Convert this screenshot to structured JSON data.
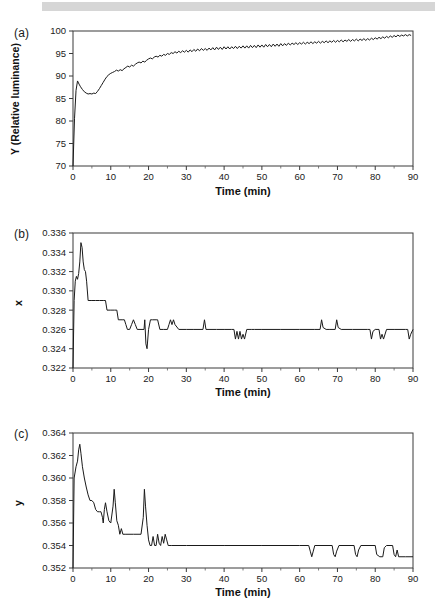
{
  "figure": {
    "background_color": "#ffffff",
    "line_color": "#1a1a1a",
    "axis_color": "#3a3a3a",
    "scan_band_color": "#d6d6d6"
  },
  "panels": [
    {
      "label": "(a)",
      "ylabel": "Y (Relative luminance)",
      "xlabel": "Time (min)",
      "yticks": [
        "70",
        "75",
        "80",
        "85",
        "90",
        "95",
        "100"
      ],
      "xticks": [
        "0",
        "10",
        "20",
        "30",
        "40",
        "50",
        "60",
        "70",
        "80",
        "90"
      ]
    },
    {
      "label": "(b)",
      "ylabel": "x",
      "xlabel": "Time (min)",
      "yticks": [
        "0.322",
        "0.324",
        "0.326",
        "0.328",
        "0.330",
        "0.332",
        "0.334",
        "0.336"
      ],
      "xticks": [
        "0",
        "10",
        "20",
        "30",
        "40",
        "50",
        "60",
        "70",
        "80",
        "90"
      ]
    },
    {
      "label": "(c)",
      "ylabel": "y",
      "xlabel": "Time (min)",
      "yticks": [
        "0.352",
        "0.354",
        "0.356",
        "0.358",
        "0.360",
        "0.362",
        "0.364"
      ],
      "xticks": [
        "0",
        "10",
        "20",
        "30",
        "40",
        "50",
        "60",
        "70",
        "80",
        "90"
      ]
    }
  ],
  "chart_data": [
    {
      "type": "line",
      "panel": "(a)",
      "title": "",
      "xlabel": "Time (min)",
      "ylabel": "Y (Relative luminance)",
      "xlim": [
        0,
        90
      ],
      "ylim": [
        70,
        100
      ],
      "ytick_values": [
        70,
        75,
        80,
        85,
        90,
        95,
        100
      ],
      "xtick_values": [
        0,
        10,
        20,
        30,
        40,
        50,
        60,
        70,
        80,
        90
      ],
      "grid": false,
      "legend": null,
      "x": [
        0,
        0.4,
        0.8,
        1.2,
        1.6,
        2,
        2.5,
        3,
        3.5,
        4,
        4.5,
        5,
        5.5,
        6,
        6.5,
        7,
        7.5,
        8,
        8.5,
        9,
        9.5,
        10,
        10.5,
        11,
        11.5,
        12,
        12.5,
        13,
        13.5,
        14,
        14.5,
        15,
        15.5,
        16,
        16.5,
        17,
        17.5,
        18,
        18.5,
        19,
        19.5,
        20,
        20.5,
        21,
        21.5,
        22,
        22.5,
        23,
        23.5,
        24,
        24.5,
        25,
        25.5,
        26,
        26.5,
        27,
        27.5,
        28,
        28.5,
        29,
        29.5,
        30,
        30.5,
        31,
        31.5,
        32,
        32.5,
        33,
        33.5,
        34,
        34.5,
        35,
        35.5,
        36,
        36.5,
        37,
        37.5,
        38,
        38.5,
        39,
        39.5,
        40,
        40.5,
        41,
        41.5,
        42,
        42.5,
        43,
        43.5,
        44,
        44.5,
        45,
        45.5,
        46,
        46.5,
        47,
        47.5,
        48,
        48.5,
        49,
        49.5,
        50,
        50.5,
        51,
        51.5,
        52,
        52.5,
        53,
        53.5,
        54,
        54.5,
        55,
        55.5,
        56,
        56.5,
        57,
        57.5,
        58,
        58.5,
        59,
        59.5,
        60,
        60.5,
        61,
        61.5,
        62,
        62.5,
        63,
        63.5,
        64,
        64.5,
        65,
        65.5,
        66,
        66.5,
        67,
        67.5,
        68,
        68.5,
        69,
        69.5,
        70,
        70.5,
        71,
        71.5,
        72,
        72.5,
        73,
        73.5,
        74,
        74.5,
        75,
        75.5,
        76,
        76.5,
        77,
        77.5,
        78,
        78.5,
        79,
        79.5,
        80,
        80.5,
        81,
        81.5,
        82,
        82.5,
        83,
        83.5,
        84,
        84.5,
        85,
        85.5,
        86,
        86.5,
        87,
        87.5,
        88,
        88.5,
        89,
        89.5,
        90
      ],
      "y": [
        70.0,
        80.5,
        86.8,
        88.9,
        88.2,
        87.6,
        87.0,
        86.5,
        86.2,
        86.0,
        86.1,
        86.0,
        86.2,
        86.1,
        86.6,
        87.2,
        87.9,
        88.6,
        89.3,
        89.9,
        90.3,
        90.6,
        90.8,
        91.0,
        91.3,
        91.1,
        91.4,
        91.2,
        91.6,
        91.9,
        92.2,
        92.0,
        92.4,
        92.2,
        92.6,
        92.9,
        93.1,
        92.9,
        93.3,
        93.1,
        93.5,
        93.8,
        94.0,
        93.8,
        94.2,
        94.4,
        94.2,
        94.6,
        94.4,
        94.8,
        94.6,
        95.0,
        94.8,
        95.2,
        95.0,
        95.4,
        95.1,
        95.5,
        95.2,
        95.6,
        95.3,
        95.7,
        95.3,
        95.8,
        95.4,
        95.9,
        95.5,
        96.0,
        95.6,
        96.1,
        95.7,
        96.1,
        95.7,
        96.2,
        95.8,
        96.3,
        95.8,
        96.4,
        95.9,
        96.4,
        95.9,
        96.5,
        96.0,
        96.5,
        96.0,
        96.5,
        96.1,
        96.6,
        96.1,
        96.6,
        96.2,
        96.7,
        96.2,
        96.7,
        96.2,
        96.8,
        96.3,
        96.8,
        96.3,
        96.9,
        96.4,
        96.9,
        96.4,
        97.0,
        96.5,
        97.0,
        96.5,
        97.1,
        96.6,
        97.1,
        96.6,
        97.2,
        96.7,
        97.2,
        96.8,
        97.3,
        96.9,
        97.3,
        97.0,
        97.4,
        97.0,
        97.4,
        97.1,
        97.5,
        97.1,
        97.5,
        97.2,
        97.6,
        97.2,
        97.6,
        97.3,
        97.7,
        97.3,
        97.7,
        97.4,
        97.8,
        97.4,
        97.8,
        97.5,
        97.9,
        97.5,
        97.9,
        97.6,
        98.0,
        97.6,
        98.0,
        97.7,
        98.1,
        97.7,
        98.1,
        97.8,
        98.2,
        97.8,
        98.2,
        97.9,
        98.3,
        97.9,
        98.3,
        98.0,
        98.4,
        98.1,
        98.5,
        98.2,
        98.6,
        98.3,
        98.7,
        98.4,
        98.8,
        98.5,
        98.9,
        98.6,
        99.0,
        98.7,
        99.1,
        98.8,
        99.1,
        98.9,
        99.2,
        98.9,
        99.2,
        99.0
      ]
    },
    {
      "type": "line",
      "panel": "(b)",
      "title": "",
      "xlabel": "Time (min)",
      "ylabel": "x",
      "xlim": [
        0,
        90
      ],
      "ylim": [
        0.322,
        0.336
      ],
      "ytick_values": [
        0.322,
        0.324,
        0.326,
        0.328,
        0.33,
        0.332,
        0.334,
        0.336
      ],
      "xtick_values": [
        0,
        10,
        20,
        30,
        40,
        50,
        60,
        70,
        80,
        90
      ],
      "grid": false,
      "legend": null,
      "x": [
        0,
        0.3,
        0.6,
        0.9,
        1.2,
        1.5,
        1.8,
        2.1,
        2.4,
        2.7,
        3.0,
        3.3,
        3.6,
        4.0,
        5.0,
        6.0,
        7.0,
        8.0,
        8.6,
        9.0,
        10.0,
        11.0,
        11.6,
        12.0,
        13.0,
        13.6,
        14.0,
        14.4,
        15.0,
        15.5,
        16.0,
        16.5,
        17.0,
        18.0,
        18.8,
        19.0,
        19.3,
        19.6,
        20.0,
        20.5,
        21.0,
        22.0,
        22.4,
        23.0,
        24.0,
        25.0,
        25.4,
        25.8,
        26.2,
        26.6,
        27.0,
        28.0,
        30.0,
        32.0,
        34.4,
        34.8,
        35.2,
        36.0,
        38.0,
        40.0,
        42.0,
        42.6,
        43.0,
        43.4,
        43.8,
        44.2,
        44.6,
        45.0,
        45.4,
        46.0,
        46.6,
        47.2,
        48.0,
        50.0,
        55.0,
        60.0,
        64.0,
        65.4,
        65.8,
        66.2,
        67.0,
        68.0,
        69.4,
        69.8,
        70.2,
        71.0,
        74.0,
        78.0,
        78.6,
        79.0,
        79.4,
        80.0,
        81.0,
        81.4,
        81.8,
        82.2,
        83.0,
        85.0,
        88.0,
        88.6,
        89.0,
        89.4,
        90.0
      ],
      "y": [
        0.322,
        0.329,
        0.331,
        0.3315,
        0.3312,
        0.3318,
        0.333,
        0.335,
        0.3345,
        0.333,
        0.3322,
        0.332,
        0.331,
        0.329,
        0.329,
        0.329,
        0.329,
        0.329,
        0.329,
        0.328,
        0.328,
        0.328,
        0.328,
        0.327,
        0.327,
        0.327,
        0.3265,
        0.326,
        0.326,
        0.3265,
        0.327,
        0.3265,
        0.326,
        0.326,
        0.326,
        0.327,
        0.3245,
        0.324,
        0.326,
        0.327,
        0.327,
        0.327,
        0.327,
        0.326,
        0.326,
        0.326,
        0.3265,
        0.327,
        0.3265,
        0.327,
        0.3265,
        0.326,
        0.326,
        0.326,
        0.326,
        0.327,
        0.326,
        0.326,
        0.326,
        0.326,
        0.326,
        0.326,
        0.325,
        0.3258,
        0.325,
        0.3258,
        0.325,
        0.3255,
        0.325,
        0.326,
        0.326,
        0.326,
        0.326,
        0.326,
        0.326,
        0.326,
        0.326,
        0.326,
        0.327,
        0.3262,
        0.326,
        0.326,
        0.326,
        0.327,
        0.3262,
        0.326,
        0.326,
        0.326,
        0.326,
        0.325,
        0.3258,
        0.326,
        0.326,
        0.325,
        0.3255,
        0.325,
        0.326,
        0.326,
        0.326,
        0.326,
        0.325,
        0.3255,
        0.326
      ]
    },
    {
      "type": "line",
      "panel": "(c)",
      "title": "",
      "xlabel": "Time (min)",
      "ylabel": "y",
      "xlim": [
        0,
        90
      ],
      "ylim": [
        0.352,
        0.364
      ],
      "ytick_values": [
        0.352,
        0.354,
        0.356,
        0.358,
        0.36,
        0.362,
        0.364
      ],
      "xtick_values": [
        0,
        10,
        20,
        30,
        40,
        50,
        60,
        70,
        80,
        90
      ],
      "grid": false,
      "legend": null,
      "x": [
        0,
        0.3,
        0.8,
        1.2,
        1.5,
        1.8,
        2.1,
        2.5,
        3.0,
        3.5,
        4.0,
        4.5,
        5.0,
        5.5,
        6.0,
        6.5,
        7.0,
        7.4,
        7.8,
        8.0,
        8.3,
        8.6,
        9.0,
        9.5,
        10.0,
        10.6,
        10.9,
        11.2,
        11.6,
        12.0,
        12.4,
        12.8,
        13.2,
        14.0,
        16.0,
        18.0,
        18.6,
        18.9,
        19.2,
        19.6,
        20.0,
        20.4,
        20.8,
        21.2,
        21.6,
        22.0,
        22.4,
        22.8,
        23.2,
        23.6,
        24.0,
        24.4,
        24.8,
        25.2,
        26.0,
        30.0,
        40.0,
        50.0,
        60.0,
        62.4,
        62.8,
        63.2,
        63.6,
        64.0,
        68.6,
        69.0,
        69.4,
        69.8,
        70.4,
        74.4,
        74.8,
        75.2,
        75.6,
        76.2,
        80.0,
        80.4,
        81.2,
        82.0,
        82.4,
        83.0,
        84.6,
        85.0,
        85.4,
        85.8,
        86.2,
        88.0,
        90.0
      ],
      "y": [
        0.352,
        0.36,
        0.361,
        0.3615,
        0.3625,
        0.363,
        0.3622,
        0.361,
        0.36,
        0.3592,
        0.3585,
        0.358,
        0.358,
        0.3578,
        0.3572,
        0.357,
        0.357,
        0.357,
        0.3565,
        0.356,
        0.3572,
        0.3578,
        0.357,
        0.3562,
        0.356,
        0.3575,
        0.359,
        0.3578,
        0.3562,
        0.3558,
        0.355,
        0.3555,
        0.355,
        0.355,
        0.355,
        0.355,
        0.3565,
        0.359,
        0.3575,
        0.3558,
        0.3545,
        0.354,
        0.354,
        0.3548,
        0.354,
        0.354,
        0.355,
        0.3542,
        0.354,
        0.3548,
        0.3542,
        0.355,
        0.3545,
        0.354,
        0.354,
        0.354,
        0.354,
        0.354,
        0.354,
        0.354,
        0.3535,
        0.353,
        0.3535,
        0.354,
        0.354,
        0.3532,
        0.353,
        0.3535,
        0.354,
        0.354,
        0.3532,
        0.353,
        0.3536,
        0.354,
        0.354,
        0.3532,
        0.353,
        0.353,
        0.3538,
        0.354,
        0.354,
        0.3532,
        0.353,
        0.3536,
        0.353,
        0.353,
        0.353
      ]
    }
  ]
}
